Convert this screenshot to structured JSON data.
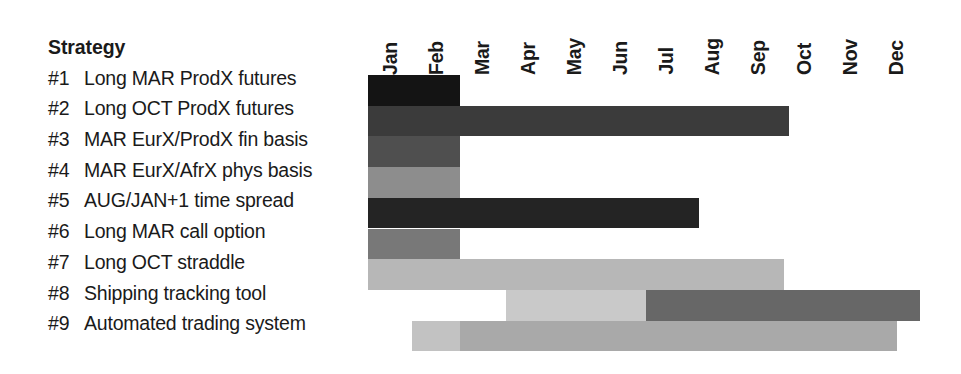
{
  "table": {
    "header_label": "Strategy"
  },
  "chart_data": {
    "type": "bar",
    "title": "Strategy",
    "xlabel": "",
    "ylabel": "",
    "orientation": "horizontal-gantt",
    "grid": false,
    "legend": "none",
    "categories": [
      "Jan",
      "Feb",
      "Mar",
      "Apr",
      "May",
      "Jun",
      "Jul",
      "Aug",
      "Sep",
      "Oct",
      "Nov",
      "Dec"
    ],
    "x_axis_months": [
      "Jan",
      "Feb",
      "Mar",
      "Apr",
      "May",
      "Jun",
      "Jul",
      "Aug",
      "Sep",
      "Oct",
      "Nov",
      "Dec"
    ],
    "rows": [
      {
        "id": "#1",
        "name": "Long MAR ProdX futures",
        "segments": [
          {
            "start_month": 0,
            "end_month": 2,
            "start_label": "Jan",
            "end_label": "Feb",
            "color": "#141414"
          }
        ]
      },
      {
        "id": "#2",
        "name": "Long OCT ProdX futures",
        "segments": [
          {
            "start_month": 0,
            "end_month": 9.15,
            "start_label": "Jan",
            "end_label": "Oct",
            "color": "#3b3b3b"
          }
        ]
      },
      {
        "id": "#3",
        "name": "MAR EurX/ProdX fin basis",
        "segments": [
          {
            "start_month": 0,
            "end_month": 2,
            "start_label": "Jan",
            "end_label": "Feb",
            "color": "#4f4f4f"
          }
        ]
      },
      {
        "id": "#4",
        "name": "MAR EurX/AfrX phys basis",
        "segments": [
          {
            "start_month": 0,
            "end_month": 2,
            "start_label": "Jan",
            "end_label": "Feb",
            "color": "#8d8d8d"
          }
        ]
      },
      {
        "id": "#5",
        "name": "AUG/JAN+1 time spread",
        "segments": [
          {
            "start_month": 0,
            "end_month": 7.2,
            "start_label": "Jan",
            "end_label": "Aug",
            "color": "#242424"
          }
        ]
      },
      {
        "id": "#6",
        "name": "Long MAR call option",
        "segments": [
          {
            "start_month": 0,
            "end_month": 2,
            "start_label": "Jan",
            "end_label": "Feb",
            "color": "#787878"
          }
        ]
      },
      {
        "id": "#7",
        "name": "Long OCT straddle",
        "segments": [
          {
            "start_month": 0,
            "end_month": 9.05,
            "start_label": "Jan",
            "end_label": "Oct",
            "color": "#b7b7b7"
          }
        ]
      },
      {
        "id": "#8",
        "name": "Shipping tracking tool",
        "segments": [
          {
            "start_month": 3.0,
            "end_month": 6.05,
            "start_label": "Apr",
            "end_label": "Jul",
            "color": "#c9c9c9"
          },
          {
            "start_month": 6.05,
            "end_month": 12.0,
            "start_label": "Jul",
            "end_label": "Dec",
            "color": "#676767"
          }
        ]
      },
      {
        "id": "#9",
        "name": "Automated trading system",
        "segments": [
          {
            "start_month": 0.95,
            "end_month": 2.0,
            "start_label": "Feb",
            "end_label": "Mar",
            "color": "#c2c2c2"
          },
          {
            "start_month": 2.0,
            "end_month": 11.5,
            "start_label": "Mar",
            "end_label": "Dec",
            "color": "#a9a9a9"
          }
        ]
      }
    ]
  }
}
